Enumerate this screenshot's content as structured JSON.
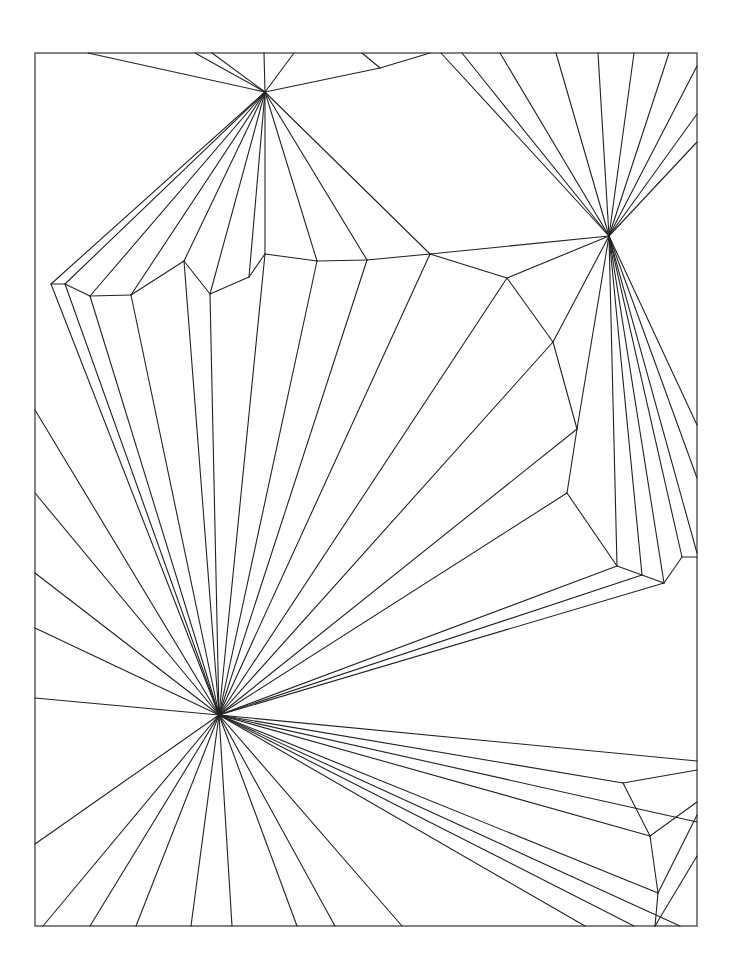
{
  "diagram": {
    "type": "fan-triangulation",
    "frame": {
      "x": 35,
      "y": 53,
      "width": 662,
      "height": 873
    },
    "stroke_color": "#222222",
    "background": "#ffffff",
    "hubs": [
      {
        "name": "top-hub",
        "x": 265,
        "y": 92
      },
      {
        "name": "right-hub",
        "x": 609,
        "y": 236
      },
      {
        "name": "bottom-left-hub",
        "x": 219,
        "y": 715
      }
    ],
    "segments": [
      [
        88,
        53,
        265,
        92
      ],
      [
        195,
        53,
        265,
        92
      ],
      [
        212,
        53,
        265,
        92
      ],
      [
        264,
        53,
        265,
        92
      ],
      [
        294,
        53,
        265,
        92
      ],
      [
        265,
        92,
        380,
        68
      ],
      [
        380,
        68,
        362,
        53
      ],
      [
        380,
        68,
        430,
        53
      ],
      [
        265,
        92,
        51,
        284
      ],
      [
        265,
        92,
        65,
        284
      ],
      [
        265,
        92,
        90,
        296
      ],
      [
        265,
        92,
        131,
        295
      ],
      [
        265,
        92,
        184,
        261
      ],
      [
        265,
        92,
        210,
        294
      ],
      [
        265,
        92,
        249,
        277
      ],
      [
        265,
        92,
        265,
        254
      ],
      [
        265,
        92,
        317,
        261
      ],
      [
        265,
        92,
        367,
        260
      ],
      [
        265,
        92,
        430,
        254
      ],
      [
        51,
        284,
        65,
        284
      ],
      [
        65,
        284,
        90,
        296
      ],
      [
        90,
        296,
        131,
        295
      ],
      [
        131,
        295,
        184,
        261
      ],
      [
        184,
        261,
        210,
        294
      ],
      [
        210,
        294,
        249,
        277
      ],
      [
        249,
        277,
        265,
        254
      ],
      [
        265,
        254,
        317,
        261
      ],
      [
        317,
        261,
        367,
        260
      ],
      [
        367,
        260,
        430,
        254
      ],
      [
        430,
        254,
        609,
        236
      ],
      [
        430,
        254,
        507,
        278
      ],
      [
        507,
        278,
        609,
        236
      ],
      [
        507,
        278,
        553,
        342
      ],
      [
        553,
        342,
        609,
        236
      ],
      [
        553,
        342,
        577,
        429
      ],
      [
        577,
        429,
        609,
        236
      ],
      [
        577,
        429,
        567,
        493
      ],
      [
        567,
        493,
        617,
        566
      ],
      [
        441,
        53,
        609,
        236
      ],
      [
        462,
        53,
        609,
        236
      ],
      [
        500,
        53,
        609,
        236
      ],
      [
        556,
        53,
        609,
        236
      ],
      [
        598,
        53,
        609,
        236
      ],
      [
        634,
        53,
        609,
        236
      ],
      [
        669,
        53,
        609,
        236
      ],
      [
        697,
        66,
        609,
        236
      ],
      [
        697,
        114,
        609,
        236
      ],
      [
        697,
        142,
        609,
        236
      ],
      [
        609,
        236,
        617,
        566
      ],
      [
        609,
        236,
        642,
        575
      ],
      [
        609,
        236,
        664,
        583
      ],
      [
        609,
        236,
        682,
        557
      ],
      [
        609,
        236,
        697,
        553
      ],
      [
        609,
        236,
        697,
        478
      ],
      [
        609,
        236,
        697,
        425
      ],
      [
        617,
        566,
        642,
        575
      ],
      [
        642,
        575,
        664,
        583
      ],
      [
        664,
        583,
        682,
        557
      ],
      [
        682,
        557,
        697,
        557
      ],
      [
        219,
        715,
        51,
        284
      ],
      [
        219,
        715,
        65,
        284
      ],
      [
        219,
        715,
        90,
        296
      ],
      [
        219,
        715,
        131,
        295
      ],
      [
        219,
        715,
        184,
        261
      ],
      [
        219,
        715,
        210,
        294
      ],
      [
        219,
        715,
        265,
        254
      ],
      [
        219,
        715,
        317,
        261
      ],
      [
        219,
        715,
        367,
        260
      ],
      [
        219,
        715,
        430,
        254
      ],
      [
        219,
        715,
        507,
        278
      ],
      [
        219,
        715,
        553,
        342
      ],
      [
        219,
        715,
        577,
        429
      ],
      [
        219,
        715,
        567,
        493
      ],
      [
        219,
        715,
        617,
        566
      ],
      [
        219,
        715,
        642,
        575
      ],
      [
        219,
        715,
        664,
        583
      ],
      [
        35,
        410,
        219,
        715
      ],
      [
        35,
        493,
        219,
        715
      ],
      [
        35,
        573,
        219,
        715
      ],
      [
        35,
        628,
        219,
        715
      ],
      [
        35,
        698,
        219,
        715
      ],
      [
        35,
        844,
        219,
        715
      ],
      [
        43,
        926,
        219,
        715
      ],
      [
        90,
        926,
        219,
        715
      ],
      [
        136,
        926,
        219,
        715
      ],
      [
        191,
        926,
        219,
        715
      ],
      [
        232,
        926,
        219,
        715
      ],
      [
        297,
        926,
        219,
        715
      ],
      [
        335,
        926,
        219,
        715
      ],
      [
        402,
        926,
        219,
        715
      ],
      [
        219,
        715,
        697,
        761
      ],
      [
        219,
        715,
        623,
        783
      ],
      [
        219,
        715,
        650,
        836
      ],
      [
        219,
        715,
        658,
        893
      ],
      [
        219,
        715,
        697,
        822
      ],
      [
        219,
        715,
        585,
        926
      ],
      [
        219,
        715,
        634,
        926
      ],
      [
        219,
        715,
        680,
        926
      ],
      [
        623,
        783,
        697,
        770
      ],
      [
        623,
        783,
        650,
        836
      ],
      [
        650,
        836,
        697,
        802
      ],
      [
        650,
        836,
        658,
        893
      ],
      [
        658,
        893,
        697,
        815
      ],
      [
        658,
        893,
        655,
        926
      ],
      [
        697,
        856,
        655,
        926
      ]
    ]
  }
}
